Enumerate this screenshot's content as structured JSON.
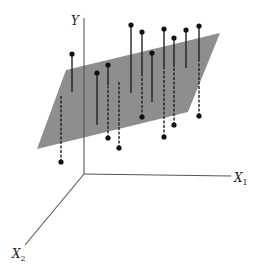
{
  "figure": {
    "type": "3d-regression-plane-diagram",
    "colors": {
      "plane": "#8e8e8e",
      "axis": "#555555",
      "stem": "#222222",
      "dot": "#111111",
      "background": "#ffffff"
    },
    "axes": {
      "y": {
        "label": "Y"
      },
      "x1": {
        "label": "X",
        "subscript": "1"
      },
      "x2": {
        "label": "X",
        "subscript": "2"
      }
    },
    "plane": {
      "corners": [
        [
          37,
          149
        ],
        [
          66,
          70
        ],
        [
          220,
          33
        ],
        [
          188,
          112
        ]
      ]
    },
    "points": [
      {
        "x": 72,
        "dot_y": 54,
        "plane_y": 92,
        "side": "above"
      },
      {
        "x": 61,
        "dot_y": 162,
        "plane_y": 95,
        "side": "below"
      },
      {
        "x": 97,
        "dot_y": 73,
        "plane_y": 125,
        "side": "above"
      },
      {
        "x": 108,
        "dot_y": 65,
        "plane_y": 85,
        "side": "above"
      },
      {
        "x": 108,
        "dot_y": 138,
        "plane_y": 84,
        "side": "below"
      },
      {
        "x": 119,
        "dot_y": 148,
        "plane_y": 81,
        "side": "below"
      },
      {
        "x": 131,
        "dot_y": 25,
        "plane_y": 93,
        "side": "above"
      },
      {
        "x": 142,
        "dot_y": 32,
        "plane_y": 75,
        "side": "above"
      },
      {
        "x": 142,
        "dot_y": 117,
        "plane_y": 75,
        "side": "below"
      },
      {
        "x": 152,
        "dot_y": 53,
        "plane_y": 102,
        "side": "above"
      },
      {
        "x": 164,
        "dot_y": 29,
        "plane_y": 69,
        "side": "above"
      },
      {
        "x": 164,
        "dot_y": 137,
        "plane_y": 69,
        "side": "below"
      },
      {
        "x": 174,
        "dot_y": 38,
        "plane_y": 67,
        "side": "above"
      },
      {
        "x": 174,
        "dot_y": 125,
        "plane_y": 67,
        "side": "below"
      },
      {
        "x": 186,
        "dot_y": 30,
        "plane_y": 68,
        "side": "above"
      },
      {
        "x": 199,
        "dot_y": 26,
        "plane_y": 62,
        "side": "above"
      },
      {
        "x": 199,
        "dot_y": 116,
        "plane_y": 62,
        "side": "below"
      }
    ]
  }
}
